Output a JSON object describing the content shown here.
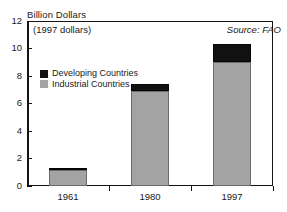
{
  "chart_data": {
    "type": "bar",
    "title": "Billion Dollars",
    "xlabel": "",
    "ylabel": "Billion Dollars",
    "categories": [
      "1961",
      "1980",
      "1997"
    ],
    "series": [
      {
        "name": "Industrial Countries",
        "color": "#a3a3a3",
        "values": [
          1.2,
          6.9,
          9.0
        ]
      },
      {
        "name": "Developing Countries",
        "color": "#111111",
        "values": [
          0.1,
          0.5,
          1.3
        ]
      }
    ],
    "totals": [
      1.3,
      7.4,
      10.3
    ],
    "stacked": true,
    "ylim": [
      0,
      12
    ],
    "yticks": [
      0,
      2,
      4,
      6,
      8,
      10,
      12
    ],
    "ytick_labels": [
      "0",
      "2",
      "4",
      "6",
      "8",
      "10",
      "12"
    ],
    "grid": false,
    "legend_position": "inside-upper-left",
    "annotations": [
      {
        "name": "currency-note",
        "text": "(1997 dollars)"
      },
      {
        "name": "source-note",
        "text": "Source: FAO"
      }
    ]
  },
  "legend": {
    "items": [
      {
        "label": "Developing Countries",
        "color": "#111111"
      },
      {
        "label": "Industrial Countries",
        "color": "#a3a3a3"
      }
    ]
  }
}
